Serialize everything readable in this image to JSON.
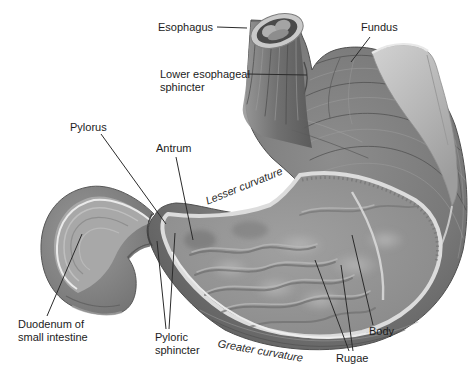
{
  "figure": {
    "labels": {
      "esophagus": "Esophagus",
      "fundus": "Fundus",
      "lower_esophageal_sphincter": "Lower esophageal sphincter",
      "pylorus": "Pylorus",
      "antrum": "Antrum",
      "lesser_curvature": "Lesser curvature",
      "duodenum": "Duodenum of small intestine",
      "pyloric_sphincter": "Pyloric sphincter",
      "greater_curvature": "Greater curvature",
      "rugae": "Rugae",
      "body": "Body"
    },
    "colors": {
      "background": "#ffffff",
      "ink": "#1c1c1c",
      "leader_line": "#2b2b2b",
      "muscle_dark": "#5f5f5f",
      "muscle_mid": "#868686",
      "interior": "#8f8f8f",
      "cut_rim": "#e6e6e6",
      "flap": "#bcbcbc"
    }
  }
}
